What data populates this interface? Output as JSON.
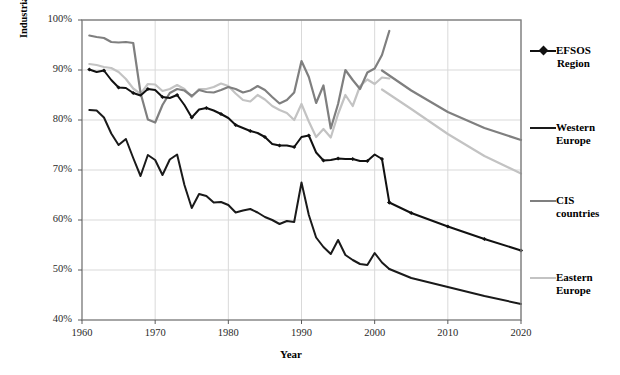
{
  "chart_data": {
    "type": "line",
    "title": "",
    "xlabel": "Year",
    "ylabel": "Industrial roundwood consumption as a proportion of total estimated consumption of wood raw materials",
    "xlim": [
      1960,
      2020
    ],
    "ylim": [
      40,
      100
    ],
    "grid": true,
    "legend_position": "right",
    "x_ticks": [
      "1960",
      "1970",
      "1980",
      "1990",
      "2000",
      "2010",
      "2020"
    ],
    "x_tick_values": [
      1960,
      1970,
      1980,
      1990,
      2000,
      2010,
      2020
    ],
    "y_ticks": [
      "40%",
      "50%",
      "60%",
      "70%",
      "80%",
      "90%",
      "100%"
    ],
    "y_tick_values": [
      40,
      50,
      60,
      70,
      80,
      90,
      100
    ],
    "series": [
      {
        "name": "EFSOS Region",
        "color": "#111111",
        "marker": "diamond",
        "width": 2.0,
        "x": [
          1961,
          1962,
          1963,
          1964,
          1965,
          1966,
          1967,
          1968,
          1969,
          1970,
          1971,
          1972,
          1973,
          1974,
          1975,
          1976,
          1977,
          1978,
          1979,
          1980,
          1981,
          1982,
          1983,
          1984,
          1985,
          1986,
          1987,
          1988,
          1989,
          1990,
          1991,
          1992,
          1993,
          1994,
          1995,
          1996,
          1997,
          1998,
          1999,
          2000,
          2001,
          2002
        ],
        "values": [
          90.1,
          89.6,
          89.9,
          88.0,
          86.5,
          86.4,
          85.4,
          84.9,
          86.2,
          86.0,
          84.6,
          84.4,
          85.0,
          83.0,
          80.5,
          82.1,
          82.4,
          81.9,
          81.2,
          80.4,
          79.0,
          78.4,
          77.8,
          77.4,
          76.6,
          75.2,
          74.9,
          74.9,
          74.6,
          76.6,
          76.9,
          73.5,
          71.9,
          72.0,
          72.3,
          72.2,
          72.2,
          71.8,
          71.8,
          73.1,
          72.2,
          63.5
        ],
        "projection_x": [
          2002,
          2005,
          2010,
          2015,
          2020
        ],
        "projection_values": [
          63.5,
          61.4,
          58.7,
          56.2,
          53.9
        ]
      },
      {
        "name": "Western Europe",
        "color": "#1a1a1a",
        "marker": "none",
        "width": 2.0,
        "x": [
          1961,
          1962,
          1963,
          1964,
          1965,
          1966,
          1967,
          1968,
          1969,
          1970,
          1971,
          1972,
          1973,
          1974,
          1975,
          1976,
          1977,
          1978,
          1979,
          1980,
          1981,
          1982,
          1983,
          1984,
          1985,
          1986,
          1987,
          1988,
          1989,
          1990,
          1991,
          1992,
          1993,
          1994,
          1995,
          1996,
          1997,
          1998,
          1999,
          2000,
          2001,
          2002
        ],
        "values": [
          82.0,
          81.9,
          80.5,
          77.3,
          75.0,
          76.2,
          72.4,
          68.8,
          73.0,
          72.0,
          69.0,
          72.1,
          73.1,
          67.0,
          62.4,
          65.2,
          64.8,
          63.5,
          63.6,
          63.0,
          61.5,
          61.9,
          62.2,
          61.5,
          60.6,
          60.0,
          59.2,
          59.8,
          59.6,
          67.5,
          61.0,
          56.5,
          54.6,
          53.2,
          56.0,
          53.0,
          52.0,
          51.2,
          51.0,
          53.4,
          51.5,
          50.2
        ],
        "projection_x": [
          2002,
          2005,
          2010,
          2015,
          2020
        ],
        "projection_values": [
          50.2,
          48.4,
          46.6,
          44.8,
          43.2
        ]
      },
      {
        "name": "CIS countries",
        "color": "#7f7f7f",
        "marker": "none",
        "width": 2.2,
        "x": [
          1961,
          1962,
          1963,
          1964,
          1965,
          1966,
          1967,
          1968,
          1969,
          1970,
          1971,
          1972,
          1973,
          1974,
          1975,
          1976,
          1977,
          1978,
          1979,
          1980,
          1981,
          1982,
          1983,
          1984,
          1985,
          1986,
          1987,
          1988,
          1989,
          1990,
          1991,
          1992,
          1993,
          1994,
          1995,
          1996,
          1997,
          1998,
          1999,
          2000,
          2001,
          2002
        ],
        "values": [
          96.9,
          96.6,
          96.4,
          95.6,
          95.5,
          95.6,
          95.4,
          85.4,
          80.1,
          79.5,
          83.0,
          85.4,
          86.2,
          85.9,
          84.8,
          86.0,
          85.6,
          85.5,
          86.0,
          86.6,
          86.2,
          85.5,
          85.9,
          86.8,
          86.0,
          84.6,
          83.3,
          84.0,
          85.5,
          91.8,
          88.6,
          83.4,
          86.9,
          78.3,
          83.2,
          90.0,
          88.0,
          86.2,
          89.5,
          90.3,
          93.0,
          97.8
        ],
        "projection_x": [
          2001,
          2005,
          2010,
          2015,
          2020
        ],
        "projection_values": [
          89.9,
          85.9,
          81.6,
          78.4,
          76.0
        ]
      },
      {
        "name": "Eastern Europe",
        "color": "#c3c3c3",
        "marker": "none",
        "width": 2.2,
        "x": [
          1961,
          1962,
          1963,
          1964,
          1965,
          1966,
          1967,
          1968,
          1969,
          1970,
          1971,
          1972,
          1973,
          1974,
          1975,
          1976,
          1977,
          1978,
          1979,
          1980,
          1981,
          1982,
          1983,
          1984,
          1985,
          1986,
          1987,
          1988,
          1989,
          1990,
          1991,
          1992,
          1993,
          1994,
          1995,
          1996,
          1997,
          1998,
          1999,
          2000,
          2001,
          2002
        ],
        "values": [
          91.2,
          91.0,
          90.6,
          90.4,
          89.6,
          88.2,
          86.3,
          85.2,
          87.2,
          87.1,
          85.8,
          86.2,
          87.0,
          86.2,
          84.6,
          86.2,
          86.2,
          86.6,
          87.3,
          86.8,
          85.3,
          84.0,
          83.7,
          85.0,
          84.1,
          82.8,
          82.0,
          81.4,
          80.0,
          83.2,
          79.7,
          76.6,
          78.2,
          76.5,
          81.2,
          85.0,
          82.8,
          86.8,
          88.1,
          87.2,
          88.5,
          88.3
        ],
        "projection_x": [
          2001,
          2005,
          2010,
          2015,
          2020
        ],
        "projection_values": [
          86.1,
          82.2,
          77.2,
          72.8,
          69.3
        ]
      }
    ]
  },
  "legend": {
    "items": [
      {
        "label_line1": "EFSOS",
        "label_line2": "Region",
        "color": "#111111",
        "marker": true
      },
      {
        "label_line1": "Western",
        "label_line2": "Europe",
        "color": "#1a1a1a",
        "marker": false
      },
      {
        "label_line1": "CIS",
        "label_line2": "countries",
        "color": "#7f7f7f",
        "marker": false
      },
      {
        "label_line1": "Eastern",
        "label_line2": "Europe",
        "color": "#c3c3c3",
        "marker": false
      }
    ]
  },
  "axes": {
    "x_title": "Year",
    "y_title": "Industrial roundwood consumption as a proportion of total estimated consumption of wood raw materials"
  },
  "colors": {
    "plot_border": "#808080",
    "gridline": "#d9d9d9",
    "background": "#ffffff"
  }
}
